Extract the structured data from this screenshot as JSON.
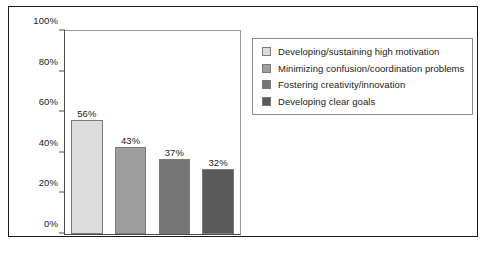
{
  "chart_data": {
    "type": "bar",
    "title": "",
    "subtitle": "",
    "xlabel": "",
    "ylabel": "",
    "categories": [
      "Developing/sustaining high motivation",
      "Minimizing confusion/coordination problems",
      "Fostering creativity/innovation",
      "Developing clear goals"
    ],
    "values": [
      56,
      43,
      37,
      32
    ],
    "value_labels": [
      "56%",
      "43%",
      "37%",
      "32%"
    ],
    "ylim": [
      0,
      100
    ],
    "yticks": [
      0,
      20,
      40,
      60,
      80,
      100
    ],
    "ytick_labels": [
      "0%",
      "20%",
      "40%",
      "60%",
      "80%",
      "100%"
    ],
    "grid": false,
    "legend_position": "right",
    "bar_colors": [
      "#dcdcdc",
      "#9e9e9e",
      "#757575",
      "#5a5a5a"
    ],
    "bar_border_color": "#7a7a7a"
  },
  "legend": {
    "items": [
      {
        "label": "Developing/sustaining high motivation",
        "color": "#dcdcdc"
      },
      {
        "label": "Minimizing confusion/coordination problems",
        "color": "#9e9e9e"
      },
      {
        "label": "Fostering creativity/innovation",
        "color": "#757575"
      },
      {
        "label": "Developing clear goals",
        "color": "#5a5a5a"
      }
    ]
  },
  "colors": {
    "frame_border": "#1a1a1a",
    "axis": "#4a4a4a",
    "plot_border_light": "#9a9a9a",
    "text": "#1a1a1a",
    "background": "#ffffff"
  }
}
